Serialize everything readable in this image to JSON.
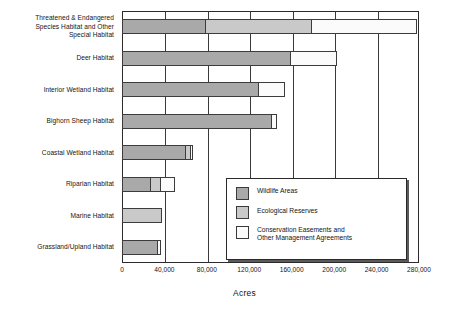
{
  "chart_data": {
    "type": "bar",
    "orientation": "horizontal",
    "stacked": true,
    "title": "",
    "xlabel": "Acres",
    "ylabel": "",
    "xlim": [
      0,
      280000
    ],
    "xticks": [
      0,
      40000,
      80000,
      120000,
      160000,
      200000,
      240000,
      280000
    ],
    "xtick_labels": [
      "0",
      "40,000",
      "80,000",
      "120,000",
      "160,000",
      "200,000",
      "240,000",
      "280,000"
    ],
    "grid": "vertical",
    "legend_position": "inside-lower-right",
    "categories": [
      "Threatened & Endangered\nSpecies Habitat and Other\nSpecial Habitat",
      "Deer Habitat",
      "Interior Wetland Habitat",
      "Bighorn Sheep Habitat",
      "Coastal Wetland Habitat",
      "Riparian Habitat",
      "Marine Habitat",
      "Grassland/Upland Habitat"
    ],
    "series": [
      {
        "name": "Wildlife Areas",
        "color": "#a9a9a9",
        "values": [
          79000,
          159000,
          129000,
          141000,
          60000,
          27000,
          0,
          34000
        ]
      },
      {
        "name": "Ecological Reserves",
        "color": "#c9c9c9",
        "values": [
          101000,
          0,
          0,
          0,
          6000,
          11000,
          38000,
          0
        ]
      },
      {
        "name": "Conservation Easements and\nOther Management Agreements",
        "color": "#fbfbfb",
        "values": [
          100000,
          45000,
          26000,
          6000,
          3000,
          14000,
          0,
          4000
        ]
      }
    ],
    "totals": [
      280000,
      204000,
      155000,
      147000,
      69000,
      52000,
      38000,
      38000
    ]
  },
  "legend": {
    "items": [
      {
        "label": "Wildlife Areas",
        "color": "#a9a9a9"
      },
      {
        "label": "Ecological Reserves",
        "color": "#c9c9c9"
      },
      {
        "label": "Conservation Easements and\nOther Management Agreements",
        "color": "#fbfbfb"
      }
    ]
  },
  "axis": {
    "x_title": "Acres"
  }
}
